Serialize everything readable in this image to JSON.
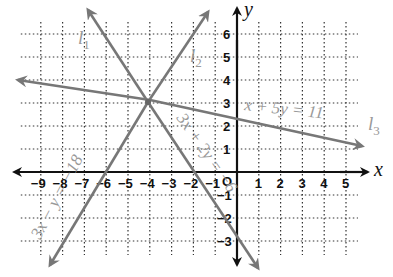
{
  "chart_data": {
    "type": "line",
    "title": "",
    "xlabel": "x",
    "ylabel": "y",
    "xlim": [
      -9,
      5
    ],
    "ylim": [
      -3,
      6
    ],
    "grid": true,
    "x_ticks": [
      "-9",
      "-8",
      "-7",
      "-6",
      "-5",
      "-4",
      "-3",
      "-2",
      "-1",
      "1",
      "2",
      "3",
      "4",
      "5"
    ],
    "y_ticks": [
      "6",
      "5",
      "4",
      "3",
      "2",
      "1",
      "-1",
      "-2",
      "-3"
    ],
    "origin_label": "O",
    "series": [
      {
        "name": "l1",
        "label": "l",
        "subscript": "1",
        "equation": "3x + 2y = −6",
        "slope": -1.5,
        "intercept": -3
      },
      {
        "name": "l2",
        "label": "l",
        "subscript": "2",
        "equation": "3x − y = −18",
        "slope": 3,
        "intercept": 18
      },
      {
        "name": "l3",
        "label": "l",
        "subscript": "3",
        "equation": "x + 5y = 11",
        "slope": -0.2,
        "intercept": 2.2
      }
    ],
    "intersection": {
      "x": -4,
      "y": 3
    }
  },
  "labels": {
    "x_axis": "x",
    "y_axis": "y",
    "origin": "O",
    "l1_main": "l",
    "l1_sub": "1",
    "l2_main": "l",
    "l2_sub": "2",
    "l3_main": "l",
    "l3_sub": "3",
    "eq_l1": "3x + 2y = −6",
    "eq_l2": "3x − y = −18",
    "eq_l3": "x + 5y = 11"
  }
}
